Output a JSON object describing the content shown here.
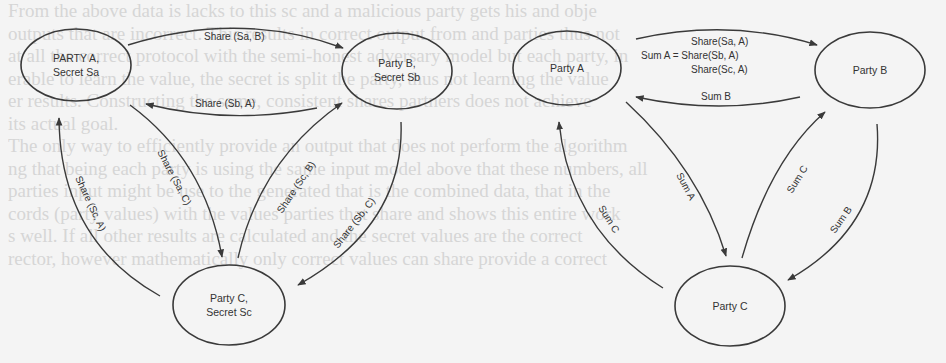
{
  "background_text": {
    "lines": [
      "From the above data is lacks to this sc and a malicious party gets his and obje",
      "outputs that are incorrect. This results in correct output from and parties thus not",
      "at all the correct protocol with the semi-honest adversary model but each party, in",
      "erable to learn the value, the secret is split the party, thus not learning the value",
      "er results. Constructing the same, consistent shares partners does not achieve",
      "its actual goal.",
      "   The only way to efficiently provide an output that does not perform the algorithm",
      "ng that being each party is using the same input model above that these numbers, all",
      "parties input might be use to the generated that is the combined data, that in the",
      "cords (party values) with the values parties that share and shows this entire work",
      "s well. If all other results are calculated and the secret values are the correct",
      "rector, however mathematically only correct values can share provide a correct"
    ]
  },
  "diagrams": [
    {
      "id": "share-phase",
      "nodes": [
        {
          "id": "A",
          "label_lines": [
            "PARTY A,",
            "Secret Sa"
          ]
        },
        {
          "id": "B",
          "label_lines": [
            "Party B,",
            "Secret Sb"
          ]
        },
        {
          "id": "C",
          "label_lines": [
            "Party C,",
            "Secret Sc"
          ]
        }
      ],
      "edges": [
        {
          "from": "A",
          "to": "B",
          "label": "Share (Sa, B)"
        },
        {
          "from": "B",
          "to": "A",
          "label": "Share (Sb, A)"
        },
        {
          "from": "A",
          "to": "C",
          "label": "Share (Sa, C)"
        },
        {
          "from": "C",
          "to": "B",
          "label": "Share (Sc, B)"
        },
        {
          "from": "B",
          "to": "C",
          "label": "Share (Sb, C)"
        },
        {
          "from": "C",
          "to": "A",
          "label": "Share (Sc, A)"
        }
      ]
    },
    {
      "id": "sum-phase",
      "nodes": [
        {
          "id": "A",
          "label_lines": [
            "Party A"
          ]
        },
        {
          "id": "B",
          "label_lines": [
            "Party B"
          ]
        },
        {
          "id": "C",
          "label_lines": [
            "Party C"
          ]
        }
      ],
      "edges": [
        {
          "from": "A",
          "to": "B",
          "label": "Sum A",
          "label_lines": [
            "Share(Sa, A)",
            "Sum A = Share(Sb, A)",
            "Share(Sc, A)"
          ]
        },
        {
          "from": "B",
          "to": "A",
          "label": "Sum B"
        },
        {
          "from": "A",
          "to": "C",
          "label": "Sum A"
        },
        {
          "from": "C",
          "to": "B",
          "label": "Sum C"
        },
        {
          "from": "B",
          "to": "C",
          "label": "Sum B"
        },
        {
          "from": "C",
          "to": "A",
          "label": "Sum C"
        }
      ]
    }
  ],
  "colors": {
    "background": "#f4f4f4",
    "stroke": "#3a3a3a",
    "text": "#333333",
    "bleed_text": "#d6d6d6"
  }
}
